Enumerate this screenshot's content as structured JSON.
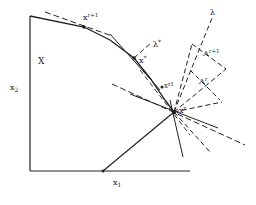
{
  "labels": {
    "region": "X",
    "y_axis": "x",
    "y_axis_sub": "2",
    "x_axis": "x",
    "x_axis_sub": "1",
    "x_r1": "x",
    "x_r1_sup": "r+1",
    "x_star": "x",
    "x_star_sup": "*",
    "lambda_star": "λ",
    "lambda_star_sup": "*",
    "x_r_one": "x",
    "x_r_one_sup": "r1",
    "x_r": "x",
    "x_r_sup": "r",
    "lambda": "λ",
    "Lambda_r1": "Λ",
    "Lambda_r1_sup": "r+1",
    "Lambda_r": "Λ",
    "Lambda_r_sup": "r"
  },
  "colors": {
    "ink": "#222222",
    "background": "#ffffff"
  }
}
